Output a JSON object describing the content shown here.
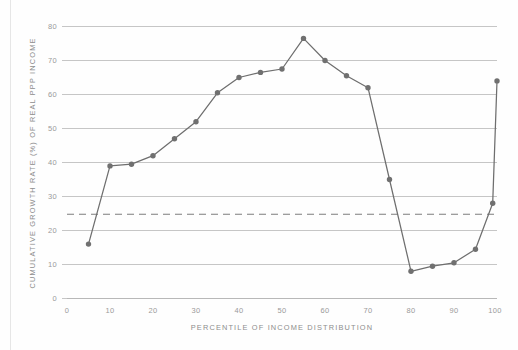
{
  "chart_data": {
    "type": "line",
    "title": "",
    "subtitle": "",
    "xlabel": "PERCENTILE OF INCOME DISTRIBUTION",
    "ylabel": "CUMULATIVE GROWTH RATE (%) OF REAL PPP INCOME",
    "xlim": [
      0,
      100
    ],
    "ylim": [
      0,
      80
    ],
    "xticks": [
      0,
      10,
      20,
      30,
      40,
      50,
      60,
      70,
      80,
      90,
      100
    ],
    "xtick_labels": [
      "0",
      "10",
      "20",
      "30",
      "40",
      "50",
      "60",
      "70",
      "80",
      "90",
      "100"
    ],
    "yticks": [
      0,
      10,
      20,
      30,
      40,
      50,
      60,
      70,
      80
    ],
    "ytick_labels": [
      "0",
      "10",
      "20",
      "30",
      "40",
      "50",
      "60",
      "70",
      "80"
    ],
    "grid": "horizontal",
    "legend": "none",
    "series": [
      {
        "name": "Cumulative growth rate of real PPP income",
        "color": "#6e6e6e",
        "marker": "circle",
        "x": [
          5,
          10,
          15,
          20,
          25,
          30,
          35,
          40,
          45,
          50,
          55,
          60,
          65,
          70,
          75,
          80,
          85,
          90,
          95,
          99,
          100
        ],
        "values": [
          16.0,
          39.0,
          39.5,
          42.0,
          47.0,
          52.0,
          60.5,
          65.0,
          66.5,
          67.5,
          76.5,
          70.0,
          65.5,
          62.0,
          35.0,
          8.0,
          9.5,
          10.5,
          14.5,
          28.0,
          64.0
        ]
      }
    ],
    "reference_lines": [
      {
        "name": "global-average-growth",
        "orientation": "horizontal",
        "value": 24.8,
        "style": "dashed",
        "color": "#7d7d7d",
        "label": ""
      }
    ],
    "annotations": []
  },
  "axes": {
    "x_axis_name": "percentile-axis",
    "y_axis_name": "growth-rate-axis"
  }
}
